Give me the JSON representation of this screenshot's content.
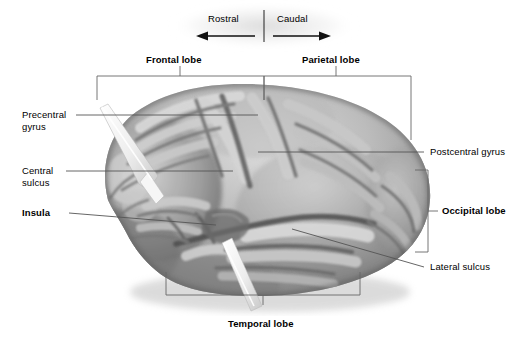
{
  "figure": {
    "type": "anatomical-illustration",
    "orientation": {
      "left_label": "Rostral",
      "right_label": "Caudal"
    }
  },
  "labels": {
    "rostral": "Rostral",
    "caudal": "Caudal",
    "frontal_lobe": "Frontal lobe",
    "parietal_lobe": "Parietal lobe",
    "precentral_gyrus": "Precentral\ngyrus",
    "central_sulcus": "Central\nsulcus",
    "insula": "Insula",
    "postcentral_gyrus": "Postcentral gyrus",
    "occipital_lobe": "Occipital lobe",
    "lateral_sulcus": "Lateral sulcus",
    "temporal_lobe": "Temporal lobe"
  },
  "style": {
    "background": "#ffffff",
    "text_color": "#000000",
    "line_color": "#555555",
    "bracket_color": "#666666",
    "brain_light": "#d8d8d8",
    "brain_mid": "#9a9a9a",
    "brain_dark": "#5a5a5a",
    "probe_color": "#f2f2f2"
  }
}
